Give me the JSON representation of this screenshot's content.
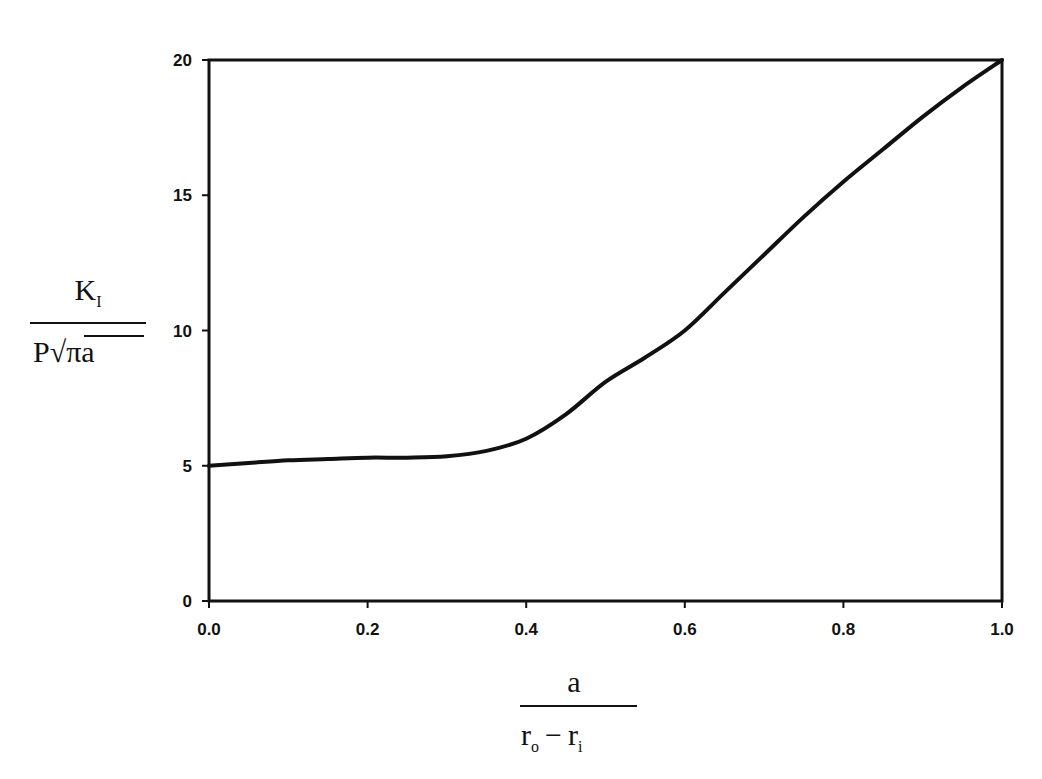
{
  "chart_data": {
    "type": "line",
    "title": "",
    "xlabel": "a / (r_o - r_i)",
    "ylabel": "K_I / (P sqrt(pi a))",
    "xlabel_parts": {
      "numerator": "a",
      "denominator_left": "r",
      "denominator_left_sub": "o",
      "minus": "−",
      "denominator_right": "r",
      "denominator_right_sub": "i"
    },
    "ylabel_parts": {
      "numerator": "K",
      "numerator_sub": "I",
      "denominator_p": "P",
      "denominator_radical": "√",
      "denominator_radicand": "πa"
    },
    "xlim": [
      0.0,
      1.0
    ],
    "ylim": [
      0,
      20
    ],
    "x_ticks": [
      "0.0",
      "0.2",
      "0.4",
      "0.6",
      "0.8",
      "1.0"
    ],
    "x_tick_values": [
      0.0,
      0.2,
      0.4,
      0.6,
      0.8,
      1.0
    ],
    "y_ticks": [
      "0",
      "5",
      "10",
      "15",
      "20"
    ],
    "y_tick_values": [
      0,
      5,
      10,
      15,
      20
    ],
    "grid": false,
    "legend": null,
    "series": [
      {
        "name": "K_I normalized",
        "color": "#111111",
        "x": [
          0.0,
          0.05,
          0.1,
          0.15,
          0.2,
          0.25,
          0.3,
          0.35,
          0.4,
          0.45,
          0.5,
          0.55,
          0.6,
          0.65,
          0.7,
          0.75,
          0.8,
          0.85,
          0.9,
          0.95,
          1.0
        ],
        "y": [
          5.0,
          5.1,
          5.2,
          5.25,
          5.3,
          5.3,
          5.35,
          5.55,
          6.0,
          6.9,
          8.1,
          9.0,
          10.0,
          11.4,
          12.8,
          14.2,
          15.5,
          16.7,
          17.9,
          19.0,
          20.0
        ]
      }
    ]
  }
}
